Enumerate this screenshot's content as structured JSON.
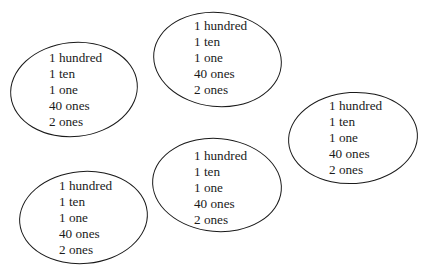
{
  "groups": [
    {
      "id": "left",
      "lines": [
        "1 hundred",
        "1 ten",
        "1 one",
        "40 ones",
        "2 ones"
      ]
    },
    {
      "id": "top-center",
      "lines": [
        "1 hundred",
        "1 ten",
        "1 one",
        "40 ones",
        "2 ones"
      ]
    },
    {
      "id": "right",
      "lines": [
        "1 hundred",
        "1 ten",
        "1 one",
        "40 ones",
        "2 ones"
      ]
    },
    {
      "id": "bottom-center",
      "lines": [
        "1 hundred",
        "1 ten",
        "1 one",
        "40 ones",
        "2 ones"
      ]
    },
    {
      "id": "bottom-left",
      "lines": [
        "1 hundred",
        "1 ten",
        "1 one",
        "40 ones",
        "2 ones"
      ]
    }
  ]
}
